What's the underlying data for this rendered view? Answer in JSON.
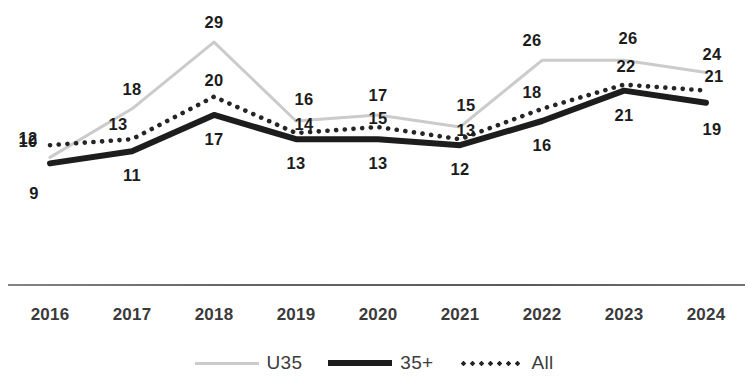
{
  "chart_data": {
    "type": "line",
    "title": "",
    "subtitle": "",
    "xlabel": "",
    "ylabel": "",
    "categories": [
      "2016",
      "2017",
      "2018",
      "2019",
      "2020",
      "2021",
      "2022",
      "2023",
      "2024"
    ],
    "ylim": [
      0,
      31
    ],
    "grid": false,
    "legend_position": "bottom-center",
    "series": [
      {
        "name": "U35",
        "style": "solid-light",
        "color": "#cbcbcb",
        "values": [
          10,
          18,
          29,
          16,
          17,
          15,
          26,
          26,
          24
        ],
        "label_position": "above"
      },
      {
        "name": "35+",
        "style": "solid-bold",
        "color": "#1d1d1d",
        "values": [
          9,
          11,
          17,
          13,
          13,
          12,
          16,
          21,
          19
        ],
        "label_position": "below"
      },
      {
        "name": "All",
        "style": "dotted",
        "color": "#252525",
        "values": [
          12,
          13,
          20,
          14,
          15,
          13,
          18,
          22,
          21
        ],
        "label_position": "above"
      }
    ]
  },
  "axis": {
    "tick_labels": [
      "2016",
      "2017",
      "2018",
      "2019",
      "2020",
      "2021",
      "2022",
      "2023",
      "2024"
    ]
  },
  "legend": {
    "items": [
      {
        "label": "U35",
        "swatch": "light-line-swatch"
      },
      {
        "label": "35+",
        "swatch": "bold-line-swatch"
      },
      {
        "label": "All",
        "swatch": "dotted-line-swatch"
      }
    ]
  }
}
